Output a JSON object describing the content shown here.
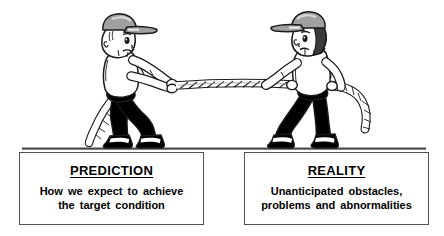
{
  "illustration": {
    "name": "tug-of-war-two-boys",
    "description": "Two cartoon boys in caps pulling opposite ends of a twisted rope in a tug of war, standing on a ground line",
    "colors": {
      "outline": "#1a1a1a",
      "skin": "#ffffff",
      "shirt": "#ffffff",
      "pants": "#000000",
      "cap": "#a0a0a0",
      "cap_highlight": "#d9d9d9",
      "hair": "#3a3a3a",
      "rope": "#ffffff",
      "ground": "#4a4a4a",
      "shoe": "#000000",
      "shoe_band": "#ffffff"
    },
    "left_figure": {
      "name": "boy-prediction",
      "pose": "leaning back, pulling rope to the left",
      "cap_brim_direction": "right"
    },
    "right_figure": {
      "name": "boy-reality",
      "pose": "leaning forward, legs spread, pulling rope to the right",
      "cap_brim_direction": "left"
    },
    "rope": {
      "name": "tug-of-war-rope",
      "style": "twisted braid"
    }
  },
  "boxes": [
    {
      "id": "prediction",
      "title": "PREDICTION",
      "body": "How we expect to achieve\nthe target condition"
    },
    {
      "id": "reality",
      "title": "REALITY",
      "body": "Unanticipated obstacles,\nproblems and abnormalities"
    }
  ]
}
